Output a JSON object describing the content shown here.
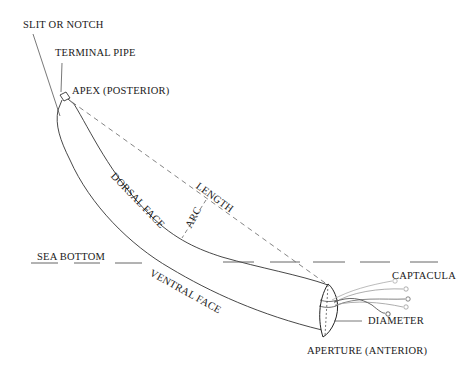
{
  "diagram": {
    "labels": {
      "slit_or_notch": "SLIT OR NOTCH",
      "terminal_pipe": "TERMINAL PIPE",
      "apex": "APEX (POSTERIOR)",
      "dorsal_face": "DORSAL FACE",
      "arc": "ARC",
      "length": "LENGTH",
      "sea_bottom": "SEA BOTTOM",
      "ventral_face": "VENTRAL FACE",
      "captacula": "CAPTACULA",
      "diameter": "DIAMETER",
      "aperture": "APERTURE (ANTERIOR)"
    },
    "colors": {
      "line": "#333333",
      "dashed": "#777777",
      "captacula_light": "#999999",
      "text": "#1a1a1a",
      "background": "#ffffff"
    }
  }
}
